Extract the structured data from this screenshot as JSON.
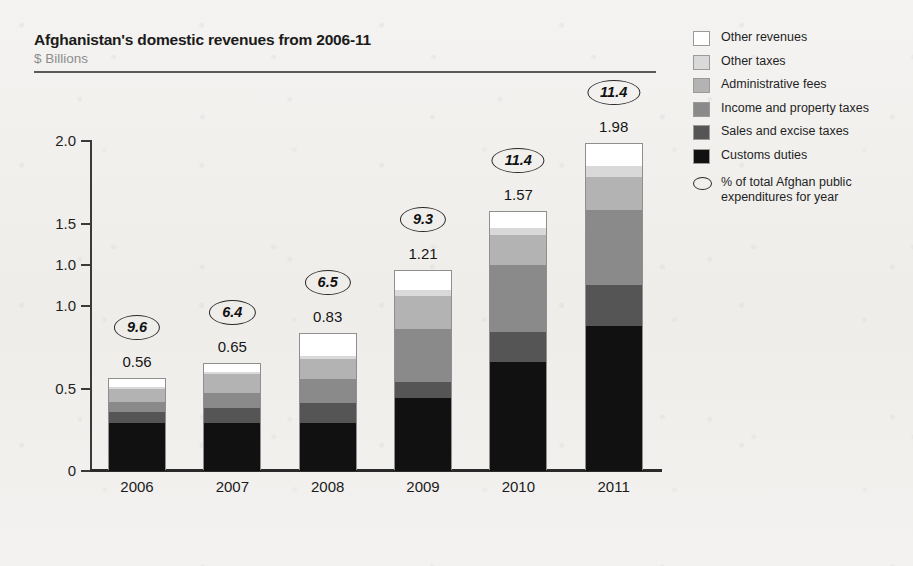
{
  "header": {
    "title": "Afghanistan's domestic revenues from 2006-11",
    "subtitle": "$ Billions"
  },
  "legend": {
    "items": [
      {
        "label": "Other revenues",
        "color": "#ffffff"
      },
      {
        "label": "Other taxes",
        "color": "#d9d9d9"
      },
      {
        "label": "Administrative fees",
        "color": "#b3b3b3"
      },
      {
        "label": "Income and property taxes",
        "color": "#8a8a8a"
      },
      {
        "label": "Sales and excise taxes",
        "color": "#555555"
      },
      {
        "label": "Customs duties",
        "color": "#111111"
      }
    ],
    "note": "% of total Afghan public expenditures for year",
    "note_icon": "oval-badge-icon"
  },
  "chart_data": {
    "type": "bar",
    "stacked": true,
    "title": "Afghanistan's domestic revenues from 2006-11",
    "subtitle": "$ Billions",
    "xlabel": "",
    "ylabel": "$ Billions",
    "ylim": [
      0,
      2.0
    ],
    "y_ticks": [
      0,
      0.5,
      1.0,
      1.0,
      1.5,
      2.0
    ],
    "y_tick_labels": [
      "0",
      "0.5",
      "1.0",
      "1.0",
      "1.5",
      "2.0"
    ],
    "y_tick_positions": [
      0,
      0.5,
      1.0,
      1.25,
      1.5,
      2.0
    ],
    "grid": false,
    "legend_position": "right",
    "categories": [
      "2006",
      "2007",
      "2008",
      "2009",
      "2010",
      "2011"
    ],
    "series": [
      {
        "name": "Customs duties",
        "color": "#111111",
        "values": [
          0.29,
          0.29,
          0.29,
          0.44,
          0.66,
          0.88
        ]
      },
      {
        "name": "Sales and excise taxes",
        "color": "#555555",
        "values": [
          0.07,
          0.09,
          0.12,
          0.1,
          0.18,
          0.25
        ]
      },
      {
        "name": "Income and property taxes",
        "color": "#8a8a8a",
        "values": [
          0.06,
          0.09,
          0.15,
          0.32,
          0.41,
          0.45
        ]
      },
      {
        "name": "Administrative fees",
        "color": "#b3b3b3",
        "values": [
          0.08,
          0.12,
          0.12,
          0.2,
          0.18,
          0.2
        ]
      },
      {
        "name": "Other taxes",
        "color": "#d9d9d9",
        "values": [
          0.01,
          0.01,
          0.02,
          0.04,
          0.04,
          0.07
        ]
      },
      {
        "name": "Other revenues",
        "color": "#ffffff",
        "values": [
          0.05,
          0.05,
          0.13,
          0.11,
          0.1,
          0.13
        ]
      }
    ],
    "totals": [
      0.56,
      0.65,
      0.83,
      1.21,
      1.57,
      1.98
    ],
    "total_labels": [
      "0.56",
      "0.65",
      "0.83",
      "1.21",
      "1.57",
      "1.98"
    ],
    "annotations": {
      "name": "% of total Afghan public expenditures for year",
      "values": [
        9.6,
        6.4,
        6.5,
        9.3,
        11.4,
        11.4
      ],
      "labels": [
        "9.6",
        "6.4",
        "6.5",
        "9.3",
        "11.4",
        "11.4"
      ]
    }
  }
}
